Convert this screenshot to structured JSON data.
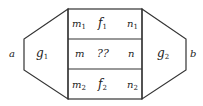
{
  "diagram": {
    "left_outer_label": "a",
    "right_outer_label": "b",
    "left_block": {
      "label": "g",
      "sub": "1"
    },
    "right_block": {
      "label": "g",
      "sub": "2"
    },
    "rows": [
      {
        "left": {
          "label": "m",
          "sub": "1"
        },
        "center": {
          "label": "f",
          "sub": "1"
        },
        "right": {
          "label": "n",
          "sub": "1"
        }
      },
      {
        "left": {
          "label": "m",
          "sub": ""
        },
        "center": {
          "label": "??",
          "sub": ""
        },
        "right": {
          "label": "n",
          "sub": ""
        }
      },
      {
        "left": {
          "label": "m",
          "sub": "2"
        },
        "center": {
          "label": "f",
          "sub": "2"
        },
        "right": {
          "label": "n",
          "sub": "2"
        }
      }
    ],
    "colors": {
      "stroke": "#333333",
      "text": "#222222",
      "background": "#ffffff"
    }
  }
}
